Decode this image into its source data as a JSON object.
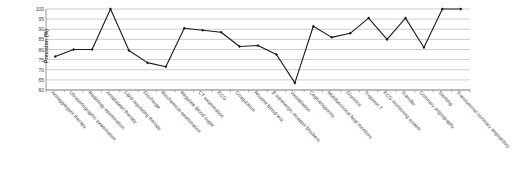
{
  "chart_data": {
    "type": "line",
    "title": "",
    "subtitle": "",
    "xlabel": "",
    "ylabel": "Precision (%)",
    "ylim": [
      60,
      100
    ],
    "ytick_labels": [
      "100",
      "95",
      "90",
      "85",
      "80",
      "75",
      "70",
      "65",
      "60"
    ],
    "ytick_values": [
      100,
      95,
      90,
      85,
      80,
      75,
      70,
      65,
      60
    ],
    "grid": true,
    "grid_axis": "y",
    "legend": false,
    "legend_position": "none",
    "marker": "diamond",
    "line_color": "#1a1a1a",
    "marker_color": "#1a1a1a",
    "categories": [
      "Antiaggregant therapy",
      "Ultrasonographic examination",
      "Radiology examination",
      "Antiplatelet therapy",
      "Lipid regulating therapy",
      "Discharge",
      "Biochemical examination",
      "Regulate blood sugar",
      "CT examination",
      "ECG",
      "Coagulation",
      "Routine blood test",
      "β adrenergic receptor blockers",
      "Vasodilation",
      "Cephalosporins",
      "Multifunctional fetal monitors",
      "Diuretics",
      "Troponin T",
      "ECG monitoring system",
      "Transfer",
      "Coronary angiography",
      "Stenting",
      "Transluminal coronary angioplasty"
    ],
    "values": [
      76.5,
      80,
      80,
      100,
      79.5,
      73.5,
      71.5,
      90.5,
      89.5,
      88.5,
      81.5,
      82,
      77.5,
      63.5,
      91.5,
      86,
      88,
      95.5,
      85,
      95.5,
      81,
      100,
      100
    ],
    "series": [
      {
        "name": "Precision",
        "values": [
          76.5,
          80,
          80,
          100,
          79.5,
          73.5,
          71.5,
          90.5,
          89.5,
          88.5,
          81.5,
          82,
          77.5,
          63.5,
          91.5,
          86,
          88,
          95.5,
          85,
          95.5,
          81,
          100,
          100
        ]
      }
    ]
  }
}
